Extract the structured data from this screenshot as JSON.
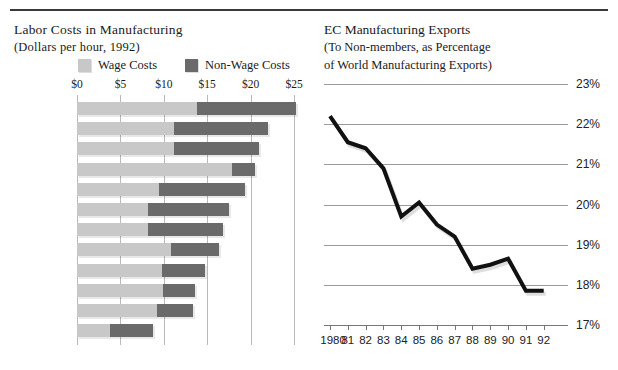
{
  "page": {
    "background": "#ffffff",
    "rule_color": "#3a3a3a"
  },
  "left_chart": {
    "title": "Labor Costs in Manufacturing",
    "subtitle": "(Dollars per hour, 1992)",
    "legend": [
      {
        "label": "Wage Costs",
        "color": "#c8c8c8",
        "key": "wage"
      },
      {
        "label": "Non-Wage Costs",
        "color": "#6a6a6a",
        "key": "nonwage"
      }
    ],
    "axis_ticks": [
      "$0",
      "$5",
      "$10",
      "$15",
      "$20",
      "$25"
    ],
    "footnote_marker": "*"
  },
  "right_chart": {
    "title": "EC Manufacturing Exports",
    "subtitle_line1": "(To Non-members, as Percentage",
    "subtitle_line2": "of World Manufacturing Exports)",
    "line_color": "#111111"
  },
  "chart_data": [
    {
      "type": "bar",
      "orientation": "horizontal",
      "stacked": true,
      "title": "Labor Costs in Manufacturing",
      "subtitle": "(Dollars per hour, 1992)",
      "xlabel": "",
      "ylabel": "",
      "xlim": [
        0,
        25
      ],
      "xticks": [
        0,
        5,
        10,
        15,
        20,
        25
      ],
      "xticklabels": [
        "$0",
        "$5",
        "$10",
        "$15",
        "$20",
        "$25"
      ],
      "grid": "vertical",
      "legend": [
        "Wage Costs",
        "Non-Wage Costs"
      ],
      "legend_position": "top",
      "categories": [
        "Germany",
        "Belgium",
        "Holland",
        "Denmark",
        "Italy",
        "France",
        "Japan",
        "U.S.",
        "Britain",
        "Spain*",
        "Ireland",
        "Greece"
      ],
      "series": [
        {
          "name": "Wage Costs",
          "color": "#c8c8c8",
          "values": [
            13.8,
            11.2,
            11.2,
            17.8,
            9.5,
            8.2,
            8.2,
            10.8,
            9.8,
            9.9,
            9.2,
            3.8
          ]
        },
        {
          "name": "Non-Wage Costs",
          "color": "#6a6a6a",
          "values": [
            11.4,
            10.8,
            9.8,
            2.7,
            9.8,
            9.3,
            8.6,
            5.6,
            4.9,
            3.7,
            4.2,
            5.0
          ]
        }
      ],
      "totals": [
        25.2,
        22.0,
        21.0,
        20.5,
        19.3,
        17.5,
        16.8,
        16.4,
        14.7,
        13.6,
        13.4,
        8.8
      ]
    },
    {
      "type": "line",
      "title": "EC Manufacturing Exports",
      "subtitle": "(To Non-members, as Percentage of World Manufacturing Exports)",
      "xlabel": "",
      "ylabel": "",
      "ylim": [
        17,
        23
      ],
      "yticks": [
        17,
        18,
        19,
        20,
        21,
        22,
        23
      ],
      "yticklabels": [
        "17%",
        "18%",
        "19%",
        "20%",
        "21%",
        "22%",
        "23%"
      ],
      "grid": "horizontal",
      "x": [
        "1980",
        "81",
        "82",
        "83",
        "84",
        "85",
        "86",
        "87",
        "88",
        "89",
        "90",
        "91",
        "92"
      ],
      "values": [
        22.2,
        21.55,
        21.4,
        20.9,
        19.7,
        20.05,
        19.5,
        19.2,
        18.4,
        18.5,
        18.65,
        17.85,
        17.85
      ],
      "series": [
        {
          "name": "EC Manufacturing Exports",
          "color": "#111111",
          "values": [
            22.2,
            21.55,
            21.4,
            20.9,
            19.7,
            20.05,
            19.5,
            19.2,
            18.4,
            18.5,
            18.65,
            17.85,
            17.85
          ]
        }
      ]
    }
  ]
}
